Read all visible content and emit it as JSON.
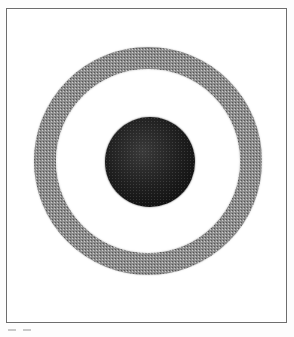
{
  "figure": {
    "kind": "scanned-diagram",
    "page_width": 294,
    "page_height": 337,
    "page_background": "#fdfdfd",
    "frame": {
      "name": "figure-border",
      "left": 6,
      "top": 8,
      "width": 281,
      "height": 315,
      "stroke_color": "#6e6e6e",
      "stroke_width": 1,
      "fill": "#ffffff"
    },
    "shapes": [
      {
        "name": "outer-ring",
        "type": "annulus",
        "center_x": 147,
        "center_y": 160,
        "outer_radius": 114,
        "inner_radius": 92,
        "band_thickness": 22,
        "fill": "#8d8d8d",
        "texture": "halftone-stipple"
      },
      {
        "name": "inner-sphere",
        "type": "disk",
        "center_x": 149,
        "center_y": 161,
        "radius": 45,
        "fill": "#1a1a1a",
        "highlight": "#3a3a3a",
        "shading": "radial-gradient-sphere",
        "texture": "grain"
      }
    ],
    "artifacts": {
      "name": "scan-edge-marks",
      "marks": [
        {
          "left": 8,
          "width": 8,
          "color": "#c9c9c9"
        },
        {
          "left": 23,
          "width": 8,
          "color": "#c9c9c9"
        }
      ]
    },
    "caption": ""
  }
}
